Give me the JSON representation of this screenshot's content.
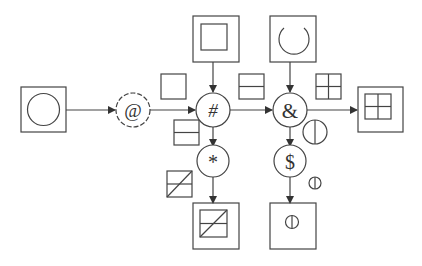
{
  "diagram": {
    "stroke_color": "#444444",
    "operators": [
      {
        "id": "op-at",
        "symbol": "@",
        "style": "dashed"
      },
      {
        "id": "op-hash",
        "symbol": "#",
        "style": "solid"
      },
      {
        "id": "op-amp",
        "symbol": "&",
        "style": "solid"
      },
      {
        "id": "op-star",
        "symbol": "*",
        "style": "solid"
      },
      {
        "id": "op-dollar",
        "symbol": "$",
        "style": "solid"
      }
    ],
    "panels": [
      {
        "id": "input-left",
        "content": "circle"
      },
      {
        "id": "input-top-1",
        "content": "open-square"
      },
      {
        "id": "input-top-2",
        "content": "open-circle"
      },
      {
        "id": "output-right",
        "content": "four-grid"
      },
      {
        "id": "output-bottom-1",
        "content": "split-square-diagonal"
      },
      {
        "id": "output-bottom-2",
        "content": "circle-vertical-line"
      }
    ],
    "edge_hints": [
      {
        "id": "hint-at-hash",
        "content": "square"
      },
      {
        "id": "hint-hash-down",
        "content": "split-square"
      },
      {
        "id": "hint-hash-amp",
        "content": "split-square"
      },
      {
        "id": "hint-amp-right",
        "content": "four-grid"
      },
      {
        "id": "hint-amp-down",
        "content": "circle-vertical-line"
      },
      {
        "id": "hint-star-down",
        "content": "split-square-diagonal"
      },
      {
        "id": "hint-dollar-down",
        "content": "small-circle-vertical-line"
      }
    ]
  }
}
